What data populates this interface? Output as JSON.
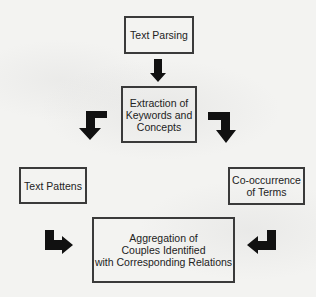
{
  "diagram": {
    "nodes": [
      {
        "id": "text-parsing",
        "label": "Text Parsing"
      },
      {
        "id": "extraction",
        "label": "Extraction of\nKeywords and\nConcepts"
      },
      {
        "id": "text-patterns",
        "label": "Text Pattens"
      },
      {
        "id": "co-occurrence",
        "label": "Co-occurrence\nof Terms"
      },
      {
        "id": "aggregation",
        "label": "Aggregation of\nCouples Identified\nwith Corresponding Relations"
      }
    ],
    "edges": [
      {
        "from": "text-parsing",
        "to": "extraction"
      },
      {
        "from": "extraction",
        "to": "text-patterns"
      },
      {
        "from": "extraction",
        "to": "co-occurrence"
      },
      {
        "from": "text-patterns",
        "to": "aggregation"
      },
      {
        "from": "co-occurrence",
        "to": "aggregation"
      }
    ],
    "colors": {
      "border": "#3a3a3a",
      "arrow": "#111111",
      "background": "#f3f3f1"
    }
  }
}
